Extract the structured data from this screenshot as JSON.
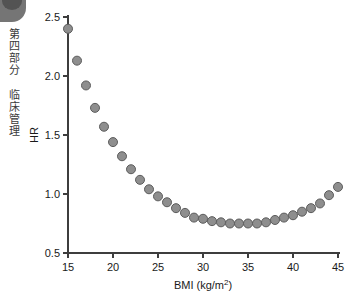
{
  "page": {
    "gutter_label": "第四部分 临床管理",
    "corner_marker": "chapter-thumb-tab"
  },
  "chart_data": {
    "type": "scatter",
    "title": "",
    "xlabel": "BMI (kg/m2)",
    "xlabel_display": "BMI (kg/m",
    "xlabel_superscript": "2",
    "xlabel_close": ")",
    "ylabel": "HR",
    "xlim": [
      15,
      45
    ],
    "ylim": [
      0.5,
      2.5
    ],
    "xticks": [
      15,
      20,
      25,
      30,
      35,
      40,
      45
    ],
    "xticklabels": [
      "15",
      "20",
      "25",
      "30",
      "35",
      "40",
      "45"
    ],
    "yticks": [
      0.5,
      1.0,
      1.5,
      2.0,
      2.5
    ],
    "yticklabels": [
      "0.5",
      "1.0",
      "1.5",
      "2.0",
      "2.5"
    ],
    "grid": false,
    "legend": null,
    "marker_fill": "#8e8e8e",
    "marker_edge": "#5c5c5c",
    "marker_size": 9,
    "background": "#ffffff",
    "x": [
      15,
      16,
      17,
      18,
      19,
      20,
      21,
      22,
      23,
      24,
      25,
      26,
      27,
      28,
      29,
      30,
      31,
      32,
      33,
      34,
      35,
      36,
      37,
      38,
      39,
      40,
      41,
      42,
      43,
      44,
      45
    ],
    "y": [
      2.4,
      2.13,
      1.92,
      1.73,
      1.57,
      1.44,
      1.32,
      1.21,
      1.12,
      1.04,
      0.98,
      0.93,
      0.88,
      0.84,
      0.8,
      0.79,
      0.77,
      0.76,
      0.75,
      0.75,
      0.75,
      0.75,
      0.76,
      0.78,
      0.8,
      0.82,
      0.85,
      0.88,
      0.92,
      0.99,
      1.06
    ],
    "series_name": "HR vs BMI"
  }
}
